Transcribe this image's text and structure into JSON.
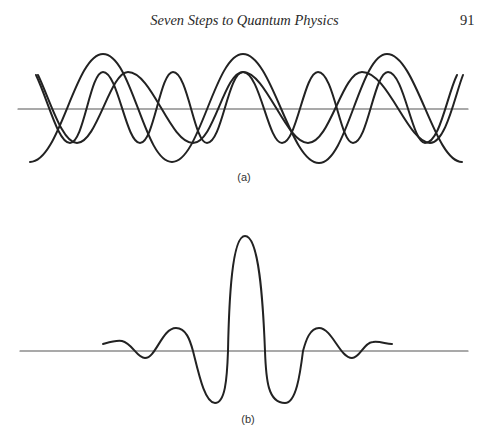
{
  "header": {
    "running_title": "Seven Steps to Quantum Physics",
    "page_number": "91"
  },
  "figure": {
    "panel_a": {
      "label": "(a)",
      "description": "Four superposed sinusoidal waves of different wavelengths and amplitudes about a horizontal axis"
    },
    "panel_b": {
      "label": "(b)",
      "description": "Superposition result: a localized wave packet with a tall central peak and decaying side oscillations"
    },
    "colors": {
      "stroke": "#222222",
      "axis": "#555555",
      "background": "#ffffff"
    }
  }
}
